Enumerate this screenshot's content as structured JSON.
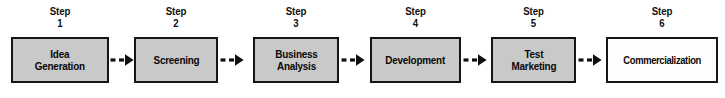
{
  "diagram": {
    "type": "process-flow",
    "orientation": "horizontal",
    "step_count": 6,
    "colors": {
      "box_fill": "#c9c9c9",
      "box_fill_last": "#fdfdfd",
      "box_border": "#151515",
      "text": "#080808",
      "arrow": "#101010",
      "background": "#ffffff"
    },
    "step_word": "Step",
    "steps": [
      {
        "number": "1",
        "caption_word": "Step",
        "label": "Idea\nGeneration",
        "label_lines": [
          "Idea",
          "Generation"
        ],
        "fill": "gray"
      },
      {
        "number": "2",
        "caption_word": "Step",
        "label": "Screening",
        "label_lines": [
          "Screening"
        ],
        "fill": "gray"
      },
      {
        "number": "3",
        "caption_word": "Step",
        "label": "Business\nAnalysis",
        "label_lines": [
          "Business",
          "Analysis"
        ],
        "fill": "gray"
      },
      {
        "number": "4",
        "caption_word": "Step",
        "label": "Development",
        "label_lines": [
          "Development"
        ],
        "fill": "gray"
      },
      {
        "number": "5",
        "caption_word": "Step",
        "label": "Test\nMarketing",
        "label_lines": [
          "Test",
          "Marketing"
        ],
        "fill": "gray"
      },
      {
        "number": "6",
        "caption_word": "Step",
        "label": "Commercialization",
        "label_lines": [
          "Commercialization"
        ],
        "fill": "white"
      }
    ],
    "connectors": [
      {
        "from": "1",
        "to": "2",
        "style": "dashed-arrow"
      },
      {
        "from": "2",
        "to": "3",
        "style": "dashed-arrow"
      },
      {
        "from": "3",
        "to": "4",
        "style": "dashed-arrow"
      },
      {
        "from": "4",
        "to": "5",
        "style": "dashed-arrow"
      },
      {
        "from": "5",
        "to": "6",
        "style": "dashed-arrow"
      }
    ]
  }
}
